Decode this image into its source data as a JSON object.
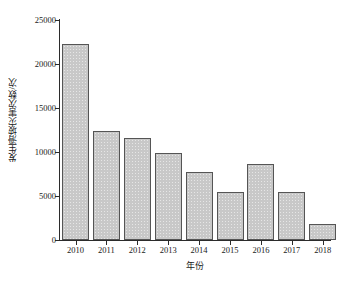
{
  "chart_data": {
    "type": "bar",
    "title": "",
    "subtitle": "",
    "xlabel": "年份",
    "ylabel": "发生滑坡灾害次数/次",
    "categories": [
      "2010",
      "2011",
      "2012",
      "2013",
      "2014",
      "2015",
      "2016",
      "2017",
      "2018"
    ],
    "values": [
      22300,
      12400,
      11600,
      9900,
      7700,
      5400,
      8600,
      5500,
      1800
    ],
    "series": [
      {
        "name": "发生滑坡灾害次数",
        "values": [
          22300,
          12400,
          11600,
          9900,
          7700,
          5400,
          8600,
          5500,
          1800
        ]
      }
    ],
    "ylim": [
      0,
      25000
    ],
    "ytick_values": [
      0,
      5000,
      10000,
      15000,
      20000,
      25000
    ],
    "ytick_labels": [
      "0",
      "5000",
      "10000",
      "15000",
      "20000",
      "25000"
    ],
    "grid": false,
    "legend": false,
    "legend_position": "none",
    "bar_fill_color": "#c8c8c8",
    "bar_edge_color": "#555555",
    "axis_color": "#2b2b2b",
    "background_color": "#ffffff"
  }
}
